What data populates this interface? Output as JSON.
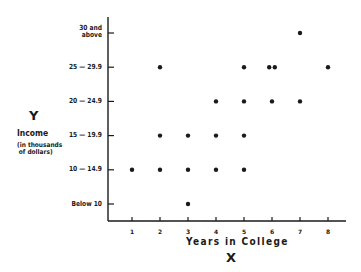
{
  "chart_data": {
    "type": "scatter",
    "title": "",
    "xlabel": "Years in College",
    "xlabel_letter": "X",
    "ylabel": "Income",
    "ylabel_letter": "Y",
    "ylabel_sub": [
      "(in thousands",
      "of dollars)"
    ],
    "x_ticks": [
      1,
      2,
      3,
      4,
      5,
      6,
      7,
      8
    ],
    "y_categories": [
      "Below 10",
      "10 — 14.9",
      "15 — 19.9",
      "20 — 24.9",
      "25 — 29.9",
      "30 and above"
    ],
    "y_category_display": [
      [
        "Below 10"
      ],
      [
        "10 — 14.9"
      ],
      [
        "15 — 19.9"
      ],
      [
        "20 — 24.9"
      ],
      [
        "25 — 29.9"
      ],
      [
        "30 and",
        "above"
      ]
    ],
    "xlim": [
      0,
      8.6
    ],
    "grid": false,
    "legend": null,
    "points": [
      {
        "x": 1,
        "y": "10 — 14.9"
      },
      {
        "x": 2,
        "y": "25 — 29.9"
      },
      {
        "x": 2,
        "y": "15 — 19.9"
      },
      {
        "x": 2,
        "y": "10 — 14.9"
      },
      {
        "x": 3,
        "y": "15 — 19.9"
      },
      {
        "x": 3,
        "y": "10 — 14.9"
      },
      {
        "x": 3,
        "y": "Below 10"
      },
      {
        "x": 4,
        "y": "20 — 24.9"
      },
      {
        "x": 4,
        "y": "15 — 19.9"
      },
      {
        "x": 4,
        "y": "10 — 14.9"
      },
      {
        "x": 5,
        "y": "25 — 29.9"
      },
      {
        "x": 5,
        "y": "20 — 24.9"
      },
      {
        "x": 5,
        "y": "15 — 19.9"
      },
      {
        "x": 5,
        "y": "10 — 14.9"
      },
      {
        "x": 5.9,
        "y": "25 — 29.9"
      },
      {
        "x": 6.1,
        "y": "25 — 29.9"
      },
      {
        "x": 6,
        "y": "20 — 24.9"
      },
      {
        "x": 7,
        "y": "30 and above"
      },
      {
        "x": 7,
        "y": "20 — 24.9"
      },
      {
        "x": 8,
        "y": "25 — 29.9"
      }
    ],
    "colors": {
      "ink": "#1a1a1a",
      "background": "#ffffff"
    }
  }
}
